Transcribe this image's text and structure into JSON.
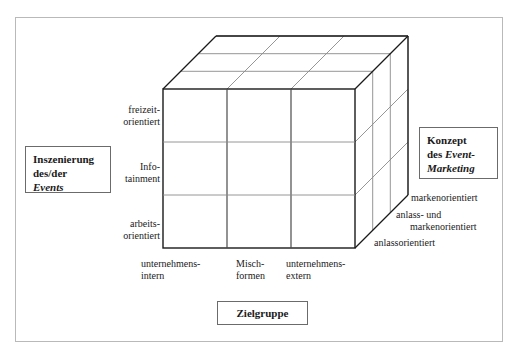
{
  "figure": {
    "title_boxes": {
      "left": {
        "name": "Inszenierung des/der Events",
        "line1": "Inszenierung",
        "line2": "des/der",
        "line3_italic": "Events"
      },
      "right": {
        "name": "Konzept des Event-Marketing",
        "line1": "Konzept",
        "line2_prefix": "des ",
        "line2_italic": "Event-",
        "line3_italic": "Marketing"
      },
      "bottom": {
        "name": "Zielgruppe",
        "label": "Zielgruppe"
      }
    },
    "axes": {
      "y": {
        "title": "Inszenierung des/der Events",
        "ticks": [
          {
            "line1": "freizeit-",
            "line2": "orientiert"
          },
          {
            "line1": "Info-",
            "line2": "tainment"
          },
          {
            "line1": "arbeits-",
            "line2": "orientiert"
          }
        ]
      },
      "x": {
        "title": "Zielgruppe",
        "ticks": [
          {
            "line1": "unternehmens-",
            "line2": "intern"
          },
          {
            "line1": "Misch-",
            "line2": "formen"
          },
          {
            "line1": "unternehmens-",
            "line2": "extern"
          }
        ]
      },
      "z": {
        "title": "Konzept des Event-Marketing",
        "ticks": [
          {
            "line1": "markenorientiert",
            "line2": ""
          },
          {
            "line1": "anlass- und",
            "line2": "markenorientiert"
          },
          {
            "line1": "anlassorientiert",
            "line2": ""
          }
        ]
      }
    },
    "colors": {
      "frame": "#b9b9b9",
      "cube_stroke": "#1a1a1a",
      "cube_inner_stroke": "#8a8a8a",
      "box_border": "#6b6b6b",
      "text": "#1a1a1a",
      "background": "#ffffff"
    },
    "geometry": {
      "cube_front_left": 163,
      "cube_front_right": 355,
      "cube_front_top": 89,
      "cube_front_bottom": 248,
      "depth_dx": 53,
      "depth_dy": -53,
      "divisions": 3
    }
  }
}
